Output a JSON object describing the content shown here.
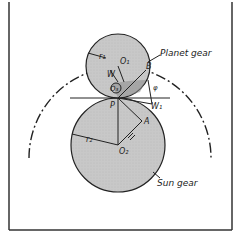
{
  "figure": {
    "labels": {
      "planet_gear": "Planet gear",
      "sun_gear": "Sun gear",
      "r1": "r₁",
      "r2": "r₂",
      "o1": "O₁",
      "o2": "O₂",
      "o3": "O₃",
      "w": "W",
      "w1": "W₁",
      "b": "B",
      "p": "P",
      "a": "A",
      "phi": "φ"
    },
    "colors": {
      "gear_fill": "#c9c9c9",
      "line": "#222222",
      "background": "#ffffff"
    }
  }
}
